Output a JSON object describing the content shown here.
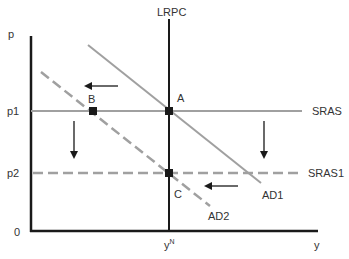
{
  "diagram": {
    "type": "AD-AS macroeconomic diagram",
    "axes": {
      "y_label": "p",
      "x_label": "y",
      "origin_label": "0",
      "price_ticks": [
        "p1",
        "p2"
      ],
      "output_tick": "y",
      "output_tick_sup": "N"
    },
    "curves": {
      "lrpc": "LRPC",
      "sras": "SRAS",
      "sras1": "SRAS1",
      "ad1": "AD1",
      "ad2": "AD2"
    },
    "points": {
      "a": "A",
      "b": "B",
      "c": "C"
    },
    "arrows": [
      {
        "name": "ad-shift-left-upper",
        "direction": "left"
      },
      {
        "name": "sras-shift-down-left",
        "direction": "down"
      },
      {
        "name": "sras-shift-down-right",
        "direction": "down"
      },
      {
        "name": "ad-shift-left-lower",
        "direction": "left"
      }
    ],
    "colors": {
      "axis": "#1a1a1a",
      "curve": "#a0a0a0",
      "point": "#1a1a1a",
      "text": "#333333"
    }
  }
}
